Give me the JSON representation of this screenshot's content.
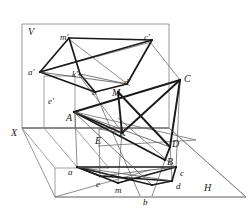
{
  "figure": {
    "kind": "descriptive-geometry-projection",
    "title": "",
    "stroke_color": "#1a1a1a",
    "thin_color": "#555555",
    "frame_color": "#8a8a8a",
    "background": "#ffffff",
    "planes": [
      {
        "name": "V",
        "label": "V",
        "label_x": 30,
        "label_y": 33
      },
      {
        "name": "H",
        "label": "H",
        "label_x": 206,
        "label_y": 190
      }
    ],
    "axes": [
      {
        "name": "X",
        "label": "X",
        "label_x": 13,
        "label_y": 136
      }
    ],
    "labels": [
      {
        "id": "V",
        "text": "V",
        "x": 28,
        "y": 27,
        "cls": "cap"
      },
      {
        "id": "X",
        "text": "X",
        "x": 11,
        "y": 128,
        "cls": "cap"
      },
      {
        "id": "H",
        "text": "H",
        "x": 204,
        "y": 183,
        "cls": "cap"
      },
      {
        "id": "m-p",
        "text": "m'",
        "x": 60,
        "y": 33,
        "cls": "pr"
      },
      {
        "id": "c-p",
        "text": "c'",
        "x": 144,
        "y": 33,
        "cls": "pr"
      },
      {
        "id": "a-p",
        "text": "a'",
        "x": 28,
        "y": 68,
        "cls": "pr"
      },
      {
        "id": "k-p",
        "text": "k'",
        "x": 72,
        "y": 70,
        "cls": "pr"
      },
      {
        "id": "d-p",
        "text": "d'",
        "x": 124,
        "y": 78,
        "cls": "pr"
      },
      {
        "id": "b-p",
        "text": "b",
        "x": 92,
        "y": 88,
        "cls": "low"
      },
      {
        "id": "M",
        "text": "M",
        "x": 112,
        "y": 88,
        "cls": "cap"
      },
      {
        "id": "e-p",
        "text": "e'",
        "x": 48,
        "y": 97,
        "cls": "pr"
      },
      {
        "id": "C",
        "text": "C",
        "x": 184,
        "y": 74,
        "cls": "cap"
      },
      {
        "id": "A",
        "text": "A",
        "x": 66,
        "y": 113,
        "cls": "cap"
      },
      {
        "id": "K",
        "text": "K",
        "x": 119,
        "y": 128,
        "cls": "cap"
      },
      {
        "id": "E",
        "text": "E",
        "x": 95,
        "y": 136,
        "cls": "cap"
      },
      {
        "id": "D",
        "text": "D",
        "x": 172,
        "y": 139,
        "cls": "cap"
      },
      {
        "id": "B",
        "text": "B",
        "x": 167,
        "y": 157,
        "cls": "cap"
      },
      {
        "id": "a",
        "text": "a",
        "x": 68,
        "y": 168,
        "cls": "low"
      },
      {
        "id": "e",
        "text": "e",
        "x": 96,
        "y": 180,
        "cls": "low"
      },
      {
        "id": "m",
        "text": "m",
        "x": 115,
        "y": 186,
        "cls": "low"
      },
      {
        "id": "c",
        "text": "c",
        "x": 180,
        "y": 169,
        "cls": "low"
      },
      {
        "id": "d",
        "text": "d",
        "x": 176,
        "y": 182,
        "cls": "low"
      },
      {
        "id": "b",
        "text": "b",
        "x": 143,
        "y": 198,
        "cls": "low"
      }
    ],
    "notes": {
      "frontal_plane": "rectangle outline upper area labelled V",
      "horizontal_plane": "oblique quadrilateral lower area labelled H",
      "triangle_space": "A B C with point D on BC",
      "triangle_frontal": "a' b' c' with d'",
      "triangle_horizontal": "a b c with d",
      "piercing_points": "M and K"
    }
  }
}
